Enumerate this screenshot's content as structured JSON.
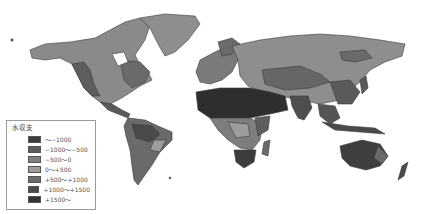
{
  "map": {
    "title": "",
    "type": "choropleth world map",
    "colors": {
      "ocean": "#ffffff",
      "outline": "#3a3a3a"
    }
  },
  "legend": {
    "title": "水収支",
    "items": [
      {
        "label": "〜−1000",
        "color": "#3c3c3c"
      },
      {
        "label": "−1000〜−500",
        "color": "#5e5e5e"
      },
      {
        "label": "−500〜0",
        "color": "#808080"
      },
      {
        "label": "0〜+500",
        "color": "#9c9c9c"
      },
      {
        "label": "+500〜+1000",
        "color": "#6a6a6a"
      },
      {
        "label": "+1000〜+1500",
        "color": "#4a4a4a"
      },
      {
        "label": "+1500〜",
        "color": "#333333"
      }
    ]
  }
}
